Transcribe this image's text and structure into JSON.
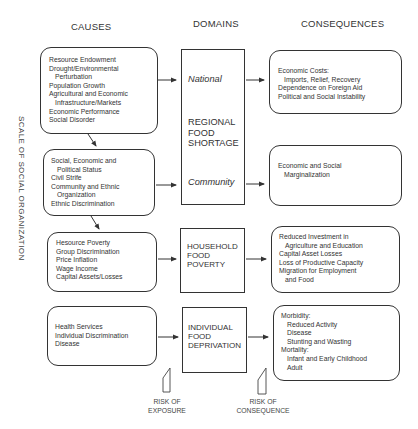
{
  "headers": {
    "causes": "CAUSES",
    "domains": "DOMAINS",
    "consequences": "CONSEQUENCES"
  },
  "side_label": "SCALE OF SOCIAL ORGANIZATION",
  "causes": [
    {
      "lines": [
        {
          "text": "Resource Endowment",
          "indent": false
        },
        {
          "text": "Drought/Environmental",
          "indent": false
        },
        {
          "text": "Perturbation",
          "indent": true
        },
        {
          "text": "Population Growth",
          "indent": false
        },
        {
          "text": "Agricultural and Economic",
          "indent": false
        },
        {
          "text": "Infrastructure/Markets",
          "indent": true
        },
        {
          "text": "Economic Performance",
          "indent": false
        },
        {
          "text": "Social Disorder",
          "indent": false
        }
      ]
    },
    {
      "lines": [
        {
          "text": "Social, Economic and",
          "indent": false
        },
        {
          "text": "Political Status",
          "indent": true
        },
        {
          "text": "Civil Strife",
          "indent": false
        },
        {
          "text": "Community and Ethnic",
          "indent": false
        },
        {
          "text": "Organization",
          "indent": true
        },
        {
          "text": "Ethnic Discrimination",
          "indent": false
        }
      ]
    },
    {
      "lines": [
        {
          "text": "Hesource Poverty",
          "indent": false
        },
        {
          "text": "Group Discrimination",
          "indent": false
        },
        {
          "text": "Price Inflation",
          "indent": false
        },
        {
          "text": "Wage Income",
          "indent": false
        },
        {
          "text": "Capital Assets/Losses",
          "indent": false
        }
      ]
    },
    {
      "lines": [
        {
          "text": "Health Services",
          "indent": false
        },
        {
          "text": "Individual Discrimination",
          "indent": false
        },
        {
          "text": "Disease",
          "indent": false
        }
      ]
    }
  ],
  "domains": {
    "regional": {
      "title_lines": [
        "REGIONAL",
        "FOOD",
        "SHORTAGE"
      ],
      "sub_national": "National",
      "sub_community": "Community"
    },
    "household": {
      "title_lines": [
        "HOUSEHOLD",
        "FOOD",
        "POVERTY"
      ]
    },
    "individual": {
      "title_lines": [
        "INDIVIDUAL",
        "FOOD",
        "DEPRIVATION"
      ]
    }
  },
  "consequences": [
    {
      "lines": [
        {
          "text": "Economic Costs:",
          "indent": false
        },
        {
          "text": "Imports, Relief, Recovery",
          "indent": true
        },
        {
          "text": "Dependence on Foreign Aid",
          "indent": false
        },
        {
          "text": "Political and Social Instability",
          "indent": false
        }
      ]
    },
    {
      "lines": [
        {
          "text": "Economic and Social",
          "indent": false
        },
        {
          "text": "Marginalization",
          "indent": true
        }
      ]
    },
    {
      "lines": [
        {
          "text": "Reduced Investment in",
          "indent": false
        },
        {
          "text": "Agriculture and Education",
          "indent": true
        },
        {
          "text": "Capital Asset Losses",
          "indent": false
        },
        {
          "text": "Loss of Productive Capacity",
          "indent": false
        },
        {
          "text": "Migration for Employment",
          "indent": false
        },
        {
          "text": "and Food",
          "indent": true
        }
      ]
    },
    {
      "lines": [
        {
          "text": "Morbidity:",
          "indent": false
        },
        {
          "text": "Reduced Activity",
          "indent": true
        },
        {
          "text": "Disease",
          "indent": true
        },
        {
          "text": "Stunting and Wasting",
          "indent": true
        },
        {
          "text": "Mortality:",
          "indent": false
        },
        {
          "text": "Infant and Early Childhood",
          "indent": true
        },
        {
          "text": "Adult",
          "indent": true
        }
      ]
    }
  ],
  "risks": {
    "exposure": [
      "RISK OF",
      "EXPOSURE"
    ],
    "consequence": [
      "RISK OF",
      "CONSEQUENCE"
    ]
  },
  "colors": {
    "line": "#333333",
    "background": "#ffffff"
  }
}
